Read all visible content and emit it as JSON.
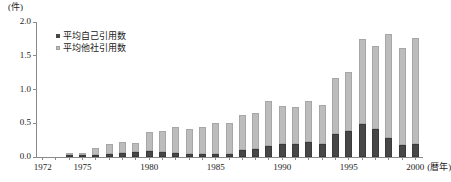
{
  "chart_data": {
    "type": "bar",
    "subtype": "stacked-bar",
    "title": "",
    "xlabel": "暦年",
    "ylabel": "",
    "yunit": "(件)",
    "ylim": [
      0.0,
      2.0
    ],
    "ytick_labels": [
      "0.0",
      "0.5",
      "1.0",
      "1.5",
      "2.0"
    ],
    "ytick_values": [
      0.0,
      0.5,
      1.0,
      1.5,
      2.0
    ],
    "grid": false,
    "legend_position": "top-left",
    "xtick_labels": [
      "1972",
      "1975",
      "1980",
      "1985",
      "1990",
      "1995",
      "2000"
    ],
    "xtick_values": [
      1972,
      1975,
      1980,
      1985,
      1990,
      1995,
      2000
    ],
    "xaxis_suffix": "(暦年)",
    "categories": [
      1972,
      1973,
      1974,
      1975,
      1976,
      1977,
      1978,
      1979,
      1980,
      1981,
      1982,
      1983,
      1984,
      1985,
      1986,
      1987,
      1988,
      1989,
      1990,
      1991,
      1992,
      1993,
      1994,
      1995,
      1996,
      1997,
      1998,
      1999,
      2000
    ],
    "series": [
      {
        "name": "平均自己引用数",
        "color": "#474747",
        "values": [
          0.0,
          0.0,
          0.01,
          0.01,
          0.01,
          0.04,
          0.06,
          0.07,
          0.09,
          0.08,
          0.06,
          0.05,
          0.04,
          0.05,
          0.05,
          0.1,
          0.12,
          0.17,
          0.2,
          0.19,
          0.22,
          0.2,
          0.34,
          0.39,
          0.49,
          0.41,
          0.28,
          0.18,
          0.19
        ]
      },
      {
        "name": "平均他社引用数",
        "color": "#bcbcbc",
        "values": [
          0.0,
          0.0,
          0.0,
          0.03,
          0.13,
          0.16,
          0.16,
          0.14,
          0.28,
          0.31,
          0.38,
          0.36,
          0.41,
          0.46,
          0.45,
          0.52,
          0.53,
          0.66,
          0.56,
          0.55,
          0.61,
          0.57,
          0.83,
          0.87,
          1.26,
          1.23,
          1.54,
          1.44,
          1.57
        ]
      }
    ],
    "totals": [
      0.0,
      0.0,
      0.01,
      0.04,
      0.14,
      0.2,
      0.22,
      0.21,
      0.37,
      0.39,
      0.44,
      0.41,
      0.45,
      0.51,
      0.5,
      0.62,
      0.65,
      0.83,
      0.76,
      0.74,
      0.83,
      0.77,
      1.17,
      1.26,
      1.75,
      1.64,
      1.82,
      1.62,
      1.76
    ]
  }
}
